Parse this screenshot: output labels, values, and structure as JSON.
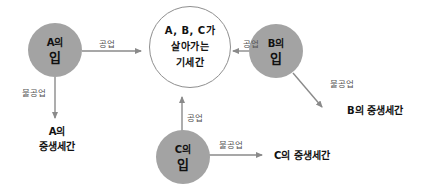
{
  "diagram": {
    "center": {
      "lines": [
        "A, B, C가",
        "살아가는",
        "기세간"
      ]
    },
    "nodes": {
      "a": {
        "title": "A의",
        "sub": "입"
      },
      "b": {
        "title": "B의",
        "sub": "입"
      },
      "c": {
        "title": "C의",
        "sub": "입"
      }
    },
    "edges": {
      "a_shared": "공업",
      "a_unshared": "불공업",
      "b_shared": "공업",
      "b_unshared": "불공업",
      "c_shared": "공업",
      "c_unshared": "불공업"
    },
    "results": {
      "a": {
        "line1": "A의",
        "line2": "중생세간"
      },
      "b": "B의 중생세간",
      "c": "C의 중생세간"
    },
    "colors": {
      "node_fill": "#a3a3a3",
      "arrow": "#8a8a8a",
      "center_border": "#8f8f8f"
    }
  }
}
